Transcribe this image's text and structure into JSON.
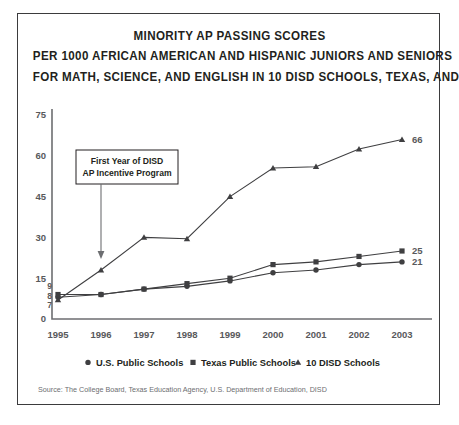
{
  "chart_data": {
    "type": "line",
    "title": "MINORITY AP PASSING SCORES PER 1000 AFRICAN AMERICAN AND HISPANIC JUNIORS AND SENIORS FOR MATH, SCIENCE, AND ENGLISH IN 10 DISD SCHOOLS, TEXAS, AND THE U.S.",
    "title_lines": [
      "MINORITY AP PASSING SCORES",
      "PER 1000 AFRICAN AMERICAN AND HISPANIC JUNIORS AND SENIORS",
      "FOR MATH, SCIENCE, AND ENGLISH IN 10 DISD SCHOOLS, TEXAS, AND THE U.S."
    ],
    "xlabel": "",
    "ylabel": "",
    "categories": [
      "1995",
      "1996",
      "1997",
      "1998",
      "1999",
      "2000",
      "2001",
      "2002",
      "2003"
    ],
    "ylim": [
      0,
      75
    ],
    "yticks": [
      "0",
      "15",
      "30",
      "45",
      "60",
      "75"
    ],
    "grid": false,
    "legend_position": "bottom",
    "series": [
      {
        "name": "U.S. Public Schools",
        "marker": "circle",
        "values": [
          8,
          9,
          11,
          12,
          14,
          17,
          18,
          20,
          21
        ],
        "start_label": "8",
        "end_label": "21"
      },
      {
        "name": "Texas Public Schools",
        "marker": "square",
        "values": [
          9,
          9,
          11,
          13,
          15,
          20,
          21,
          23,
          25
        ],
        "start_label": "9",
        "end_label": "25"
      },
      {
        "name": "10 DISD Schools",
        "marker": "triangle",
        "values": [
          7,
          18,
          30,
          29.5,
          45,
          55.5,
          56,
          62.5,
          66
        ],
        "start_label": "7",
        "end_label": "66"
      }
    ],
    "annotations": [
      {
        "name": "first-year-disd-callout",
        "lines": [
          "First Year of DISD",
          "AP Incentive Program"
        ],
        "points_to_year": "1996"
      }
    ],
    "source": "Source: The College Board, Texas Education Agency, U.S. Department of Education, DISD"
  },
  "legend": {
    "items": [
      {
        "label": "U.S. Public Schools",
        "marker": "circle"
      },
      {
        "label": "Texas Public Schools",
        "marker": "square"
      },
      {
        "label": "10 DISD Schools",
        "marker": "triangle"
      }
    ]
  },
  "colors": {
    "ink": "#231f20",
    "line": "#3f3f41",
    "axis": "#6d6e71",
    "muted_text": "#58595b",
    "source_text": "#6d6e71",
    "frame": "#3b3b3d",
    "background": "#ffffff"
  }
}
